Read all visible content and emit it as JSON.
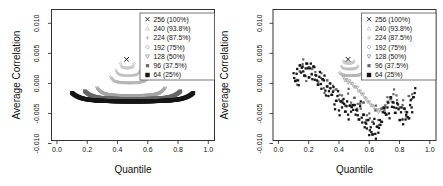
{
  "figure": {
    "width": 443,
    "height": 186,
    "background": "#ffffff"
  },
  "chart_data": [
    {
      "id": "left-panel",
      "type": "scatter",
      "xlabel": "Quantile",
      "ylabel": "Average Correlation",
      "xlim": [
        -0.036,
        1.041
      ],
      "ylim": [
        -0.0095,
        0.0123
      ],
      "xticks": [
        0.0,
        0.2,
        0.4,
        0.6,
        0.8,
        1.0
      ],
      "xtick_labels": [
        "0.0",
        "0.2",
        "0.4",
        "0.6",
        "0.8",
        "1.0"
      ],
      "yticks": [
        -0.01,
        -0.005,
        0.0,
        0.005,
        0.01
      ],
      "ytick_labels": [
        "-0.010",
        "-0.005",
        "0.000",
        "0.005",
        "0.010"
      ],
      "grid": false,
      "legend": {
        "position": "top-right",
        "entries": [
          {
            "label": "256 (100%)",
            "marker": "cross",
            "color": "#1a1a1a"
          },
          {
            "label": "240 (93.8%)",
            "marker": "triangle-up",
            "color": "#c9c9c9"
          },
          {
            "label": "224 (87.5%)",
            "marker": "plus",
            "color": "#bfbfbf"
          },
          {
            "label": "192 (75%)",
            "marker": "diamond",
            "color": "#b3b3b3"
          },
          {
            "label": "128 (50%)",
            "marker": "triangle-down",
            "color": "#a3a3a3"
          },
          {
            "label": "96 (37.5%)",
            "marker": "square-small",
            "color": "#666666"
          },
          {
            "label": "64 (25%)",
            "marker": "square",
            "color": "#161616"
          }
        ]
      },
      "series": [
        {
          "name": "240 (93.8%)",
          "marker": "triangle-up",
          "color": "#c9c9c9",
          "arc": {
            "xc": 0.465,
            "hw": 0.045,
            "yc": 0.0026,
            "rise": 0.0008
          }
        },
        {
          "name": "224 (87.5%)",
          "marker": "plus",
          "color": "#bfbfbf",
          "arc": {
            "xc": 0.47,
            "hw": 0.08,
            "yc": 0.0013,
            "rise": 0.0009
          }
        },
        {
          "name": "192 (75%)",
          "marker": "diamond",
          "color": "#b3b3b3",
          "arc": {
            "xc": 0.48,
            "hw": 0.125,
            "yc": 0.0001,
            "rise": 0.001
          }
        },
        {
          "name": "128 (50%)",
          "marker": "triangle-down",
          "color": "#a3a3a3",
          "arc": {
            "xc": 0.49,
            "hw": 0.225,
            "yc": -0.0021,
            "rise": 0.0013
          }
        },
        {
          "name": "96 (37.5%)",
          "marker": "square-small",
          "color": "#666666",
          "arc": {
            "xc": 0.5,
            "hw": 0.315,
            "yc": -0.0026,
            "rise": 0.0013
          }
        },
        {
          "name": "64 (25%)",
          "marker": "square",
          "color": "#161616",
          "arc": {
            "xc": 0.5,
            "hw": 0.4,
            "yc": -0.003,
            "rise": 0.0014
          }
        },
        {
          "name": "256 (100%)",
          "marker": "cross",
          "color": "#1a1a1a",
          "points": [
            [
              0.46,
              0.004
            ]
          ]
        }
      ]
    },
    {
      "id": "right-panel",
      "type": "scatter",
      "xlabel": "Quantile",
      "ylabel": "Average Correlation",
      "xlim": [
        -0.036,
        1.041
      ],
      "ylim": [
        -0.0095,
        0.0123
      ],
      "xticks": [
        0.0,
        0.2,
        0.4,
        0.6,
        0.8,
        1.0
      ],
      "xtick_labels": [
        "0.0",
        "0.2",
        "0.4",
        "0.6",
        "0.8",
        "1.0"
      ],
      "yticks": [
        -0.01,
        -0.005,
        0.0,
        0.005,
        0.01
      ],
      "ytick_labels": [
        "-0.010",
        "-0.005",
        "0.000",
        "0.005",
        "0.010"
      ],
      "grid": false,
      "legend": {
        "position": "top-right",
        "entries": [
          {
            "label": "256 (100%)",
            "marker": "cross",
            "color": "#1a1a1a"
          },
          {
            "label": "240 (93.8%)",
            "marker": "triangle-up",
            "color": "#c9c9c9"
          },
          {
            "label": "224 (87.5%)",
            "marker": "plus",
            "color": "#bfbfbf"
          },
          {
            "label": "192 (75%)",
            "marker": "diamond",
            "color": "#b3b3b3"
          },
          {
            "label": "128 (50%)",
            "marker": "triangle-down",
            "color": "#a3a3a3"
          },
          {
            "label": "96 (37.5%)",
            "marker": "square-small",
            "color": "#666666"
          },
          {
            "label": "64 (25%)",
            "marker": "square",
            "color": "#161616"
          }
        ]
      },
      "series": [
        {
          "name": "240 (93.8%)",
          "marker": "triangle-up",
          "color": "#c9c9c9",
          "arc": {
            "xc": 0.465,
            "hw": 0.035,
            "yc": 0.0034,
            "rise": 0.0004
          }
        },
        {
          "name": "224 (87.5%)",
          "marker": "plus",
          "color": "#bfbfbf",
          "arc": {
            "xc": 0.47,
            "hw": 0.055,
            "yc": 0.0024,
            "rise": 0.0005
          }
        },
        {
          "name": "192 (75%)",
          "marker": "diamond",
          "color": "#b3b3b3",
          "arc": {
            "xc": 0.48,
            "hw": 0.075,
            "yc": 0.0013,
            "rise": 0.0005
          }
        },
        {
          "name": "128 (50%)",
          "marker": "triangle-down",
          "color": "#a3a3a3",
          "x_start": 0.43,
          "x_step": 0.01,
          "y_unit": 0.0001,
          "y": [
            10,
            5,
            6,
            1,
            4,
            0,
            -1,
            -6,
            -6,
            -7,
            -13,
            -13,
            -18,
            -18,
            -24,
            -26,
            -31,
            -31,
            -36,
            -37,
            -39,
            -44,
            -44,
            -48,
            -44,
            -45,
            -42,
            -42,
            -37,
            -31,
            -31
          ]
        },
        {
          "name": "96 (37.5%)",
          "marker": "square-small",
          "color": "#666666",
          "jitter_clone": true,
          "x_start": 0.12,
          "x_step": 0.02,
          "y_unit": 0.0001,
          "y": [
            6,
            20,
            32,
            12,
            27,
            16,
            27,
            3,
            9,
            -8,
            5,
            -8,
            -4,
            -10,
            -27,
            -20,
            -37,
            -17,
            -32,
            -24,
            -42,
            -34,
            -32,
            -61,
            -50,
            -64,
            -45,
            -61,
            -42,
            -45,
            -23,
            -26,
            -18,
            -20,
            -40,
            -36,
            -47,
            -21,
            -26
          ]
        },
        {
          "name": "64 (25%)",
          "marker": "square",
          "color": "#161616",
          "jitter_clone": true,
          "x_start": 0.1,
          "x_step": 0.01,
          "y_unit": 0.0001,
          "y": [
            17,
            4,
            16,
            5,
            30,
            18,
            28,
            13,
            25,
            33,
            10,
            25,
            15,
            28,
            6,
            13,
            -2,
            11,
            -1,
            7,
            5,
            -12,
            -5,
            -21,
            0,
            -19,
            -14,
            -35,
            -29,
            -21,
            -45,
            -30,
            -40,
            -26,
            -47,
            -38,
            -52,
            -37,
            -47,
            -36,
            -36,
            -52,
            -45,
            -60,
            -38,
            -57,
            -52,
            -73,
            -67,
            -61,
            -86,
            -73,
            -85,
            -67,
            -84,
            -72,
            -82,
            -61,
            -64,
            -48,
            -41,
            -52,
            -40,
            -50,
            -23,
            -39,
            -32,
            -49,
            -41,
            -35,
            -61,
            -48,
            -60,
            -42,
            -60,
            -48,
            -58,
            -36,
            -40,
            -23,
            -16
          ]
        },
        {
          "name": "256 (100%)",
          "marker": "cross",
          "color": "#1a1a1a",
          "points": [
            [
              0.46,
              0.004
            ]
          ]
        }
      ]
    }
  ]
}
